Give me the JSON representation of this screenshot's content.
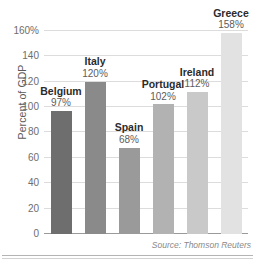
{
  "chart_data": {
    "type": "bar",
    "title": "",
    "xlabel": "",
    "ylabel": "Percent of GDP",
    "ylim": [
      0,
      170
    ],
    "grid": true,
    "legend": "none",
    "categories": [
      "Belgium",
      "Italy",
      "Spain",
      "Portugal",
      "Ireland",
      "Greece"
    ],
    "values": [
      97,
      120,
      68,
      102,
      112,
      158
    ],
    "value_labels": [
      "97%",
      "120%",
      "68%",
      "102%",
      "112%",
      "158%"
    ],
    "bar_colors": [
      "#6e6e6e",
      "#8a8a8a",
      "#9a9a9a",
      "#b2b2b2",
      "#c9c9c9",
      "#e2e2e2"
    ],
    "yticks": [
      0,
      20,
      40,
      60,
      80,
      100,
      120,
      140,
      160
    ],
    "ytick_labels": [
      "0",
      "20",
      "40",
      "60",
      "80",
      "100",
      "120",
      "140",
      "160%"
    ],
    "annotations": [
      "Source: Thomson Reuters"
    ]
  },
  "axis": {
    "y_title": "Percent of GDP"
  },
  "footer": {
    "source": "Source: Thomson Reuters"
  }
}
